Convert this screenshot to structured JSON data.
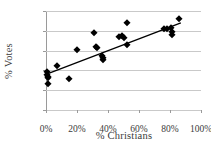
{
  "chart_data": {
    "type": "scatter",
    "title": "",
    "xlabel": "% Christians",
    "ylabel": "% Votes",
    "xlim": [
      0,
      100
    ],
    "ylim": [
      0,
      100
    ],
    "xticks": [
      "0%",
      "20%",
      "40%",
      "60%",
      "80%",
      "100%"
    ],
    "xtick_values": [
      0,
      20,
      40,
      60,
      80,
      100
    ],
    "yticks": [
      "0%",
      "20%",
      "40%",
      "60%",
      "80%",
      "100%"
    ],
    "ytick_values": [
      0,
      20,
      40,
      60,
      80,
      100
    ],
    "grid": "horizontal",
    "legend": "none",
    "marker": "diamond",
    "marker_color": "#000000",
    "points": [
      {
        "x": 0.5,
        "y": 38
      },
      {
        "x": 0.5,
        "y": 35
      },
      {
        "x": 1.0,
        "y": 32
      },
      {
        "x": 1.5,
        "y": 33
      },
      {
        "x": 1.0,
        "y": 26
      },
      {
        "x": 7.0,
        "y": 44
      },
      {
        "x": 15.0,
        "y": 31
      },
      {
        "x": 20.0,
        "y": 61
      },
      {
        "x": 31.0,
        "y": 78
      },
      {
        "x": 32.0,
        "y": 64
      },
      {
        "x": 33.0,
        "y": 63
      },
      {
        "x": 36.0,
        "y": 55
      },
      {
        "x": 36.5,
        "y": 53
      },
      {
        "x": 37.0,
        "y": 51
      },
      {
        "x": 47.0,
        "y": 74
      },
      {
        "x": 49.0,
        "y": 75
      },
      {
        "x": 50.0,
        "y": 73
      },
      {
        "x": 52.0,
        "y": 88
      },
      {
        "x": 52.0,
        "y": 66
      },
      {
        "x": 76.0,
        "y": 82
      },
      {
        "x": 78.0,
        "y": 82
      },
      {
        "x": 80.5,
        "y": 83
      },
      {
        "x": 81.0,
        "y": 79
      },
      {
        "x": 81.0,
        "y": 76
      },
      {
        "x": 85.5,
        "y": 92
      }
    ],
    "trendline": {
      "type": "linear",
      "color": "#000000",
      "x_start": 0,
      "y_start": 36,
      "x_end": 87,
      "y_end": 88
    }
  }
}
